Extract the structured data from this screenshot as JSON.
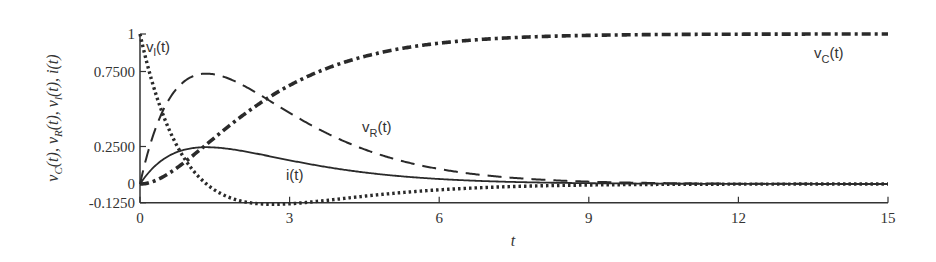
{
  "chart_data": {
    "type": "line",
    "title": "",
    "xlabel": "t",
    "ylabel": "v_C(t), v_R(t), v_l(t), i(t)",
    "xlim": [
      0,
      15
    ],
    "ylim": [
      -0.125,
      1
    ],
    "x_ticks": [
      0,
      3,
      6,
      9,
      12,
      15
    ],
    "x_tick_labels": [
      "0",
      "3",
      "6",
      "9",
      "12",
      "15"
    ],
    "y_ticks": [
      -0.125,
      0,
      0.25,
      0.75,
      1
    ],
    "y_tick_labels": [
      "-0.1250",
      "0",
      "0.2500",
      "0.7500",
      "1"
    ],
    "grid": false,
    "legend": "inline labels",
    "x": [
      0,
      0.25,
      0.5,
      0.75,
      1,
      1.333,
      1.5,
      2,
      2.5,
      2.667,
      3,
      4,
      5,
      6,
      7,
      8,
      9,
      10,
      11,
      12,
      13,
      14,
      15
    ],
    "series": [
      {
        "name": "v_C(t)",
        "style": "dash-dot heavy",
        "values": [
          0,
          0.016,
          0.055,
          0.109,
          0.173,
          0.264,
          0.311,
          0.442,
          0.559,
          0.594,
          0.657,
          0.801,
          0.888,
          0.939,
          0.967,
          0.983,
          0.991,
          0.995,
          0.998,
          0.999,
          0.999,
          1.0,
          1.0
        ]
      },
      {
        "name": "v_R(t)",
        "style": "long dash",
        "values": [
          0,
          0.311,
          0.515,
          0.64,
          0.709,
          0.736,
          0.731,
          0.669,
          0.575,
          0.541,
          0.474,
          0.299,
          0.176,
          0.1,
          0.055,
          0.03,
          0.016,
          0.008,
          0.004,
          0.002,
          0.001,
          0.001,
          0.0
        ]
      },
      {
        "name": "v_l(t)",
        "style": "dotted",
        "values": [
          1,
          0.673,
          0.43,
          0.251,
          0.118,
          0.0,
          -0.042,
          -0.112,
          -0.134,
          -0.135,
          -0.131,
          -0.1,
          -0.064,
          -0.039,
          -0.022,
          -0.012,
          -0.007,
          -0.003,
          -0.002,
          -0.001,
          -0.0,
          -0.0,
          -0.0
        ]
      },
      {
        "name": "i(t)",
        "style": "solid",
        "values": [
          0,
          0.104,
          0.172,
          0.213,
          0.236,
          0.245,
          0.244,
          0.223,
          0.192,
          0.18,
          0.158,
          0.1,
          0.059,
          0.033,
          0.018,
          0.01,
          0.005,
          0.003,
          0.001,
          0.001,
          0.0,
          0.0,
          0.0
        ]
      }
    ],
    "annotations": [
      {
        "text": "v_l(t)",
        "x": 0.15,
        "y": 0.9
      },
      {
        "text": "v_R(t)",
        "x": 4.5,
        "y": 0.38
      },
      {
        "text": "i(t)",
        "x": 3.0,
        "y": 0.1
      },
      {
        "text": "v_C(t)",
        "x": 13.5,
        "y": 0.85
      }
    ]
  },
  "labels": {
    "vl": {
      "main": "v",
      "sub": "l",
      "tail": "(t)"
    },
    "vr": {
      "main": "v",
      "sub": "R",
      "tail": "(t)"
    },
    "i": {
      "main": "i(t)"
    },
    "vc": {
      "main": "v",
      "sub": "C",
      "tail": "(t)"
    },
    "xaxis": "t"
  }
}
